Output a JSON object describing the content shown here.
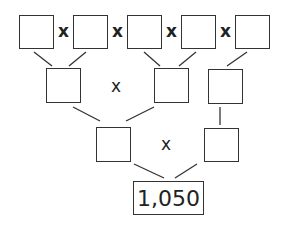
{
  "diagram": {
    "type": "factor-tree",
    "operator_symbol": "x",
    "result_value": "1,050",
    "rows": [
      {
        "level": 1,
        "box_count": 5,
        "values": [
          "",
          "",
          "",
          "",
          ""
        ]
      },
      {
        "level": 2,
        "box_count": 3,
        "values": [
          "",
          "",
          ""
        ]
      },
      {
        "level": 3,
        "box_count": 2,
        "values": [
          "",
          ""
        ]
      }
    ],
    "colors": {
      "stroke": "#333333",
      "background": "#ffffff"
    }
  }
}
